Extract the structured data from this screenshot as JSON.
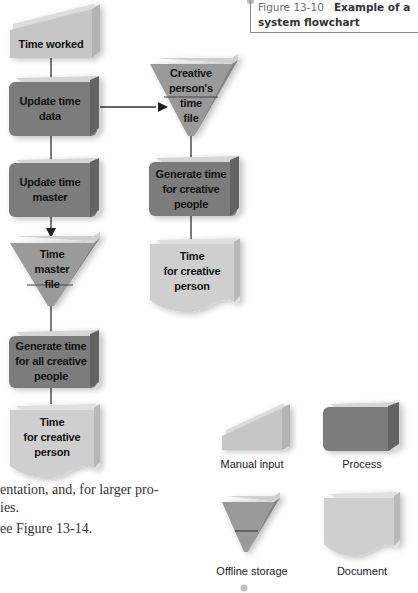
{
  "figure": {
    "number": "Figure 13-10",
    "title_line1": "Example of a",
    "title_line2": "system flowchart"
  },
  "colors": {
    "manual_input": "#c6c6c6",
    "process": "#7b7b7b",
    "storage": "#9a9a9a",
    "document": "#cfcfcf",
    "connector": "#333333"
  },
  "flowchart": {
    "nodes": [
      {
        "id": "time-worked",
        "type": "manual-input",
        "lines": [
          "Time worked"
        ]
      },
      {
        "id": "update-time-data",
        "type": "process",
        "lines": [
          "Update time",
          "data"
        ]
      },
      {
        "id": "update-time-master",
        "type": "process",
        "lines": [
          "Update time",
          "master"
        ]
      },
      {
        "id": "time-master-file",
        "type": "offline-storage",
        "lines": [
          "Time",
          "master",
          "file"
        ]
      },
      {
        "id": "generate-time-all",
        "type": "process",
        "lines": [
          "Generate time",
          "for all creative",
          "people"
        ]
      },
      {
        "id": "time-doc-left",
        "type": "document",
        "lines": [
          "Time",
          "for creative",
          "person"
        ]
      },
      {
        "id": "creative-time-file",
        "type": "offline-storage",
        "lines": [
          "Creative",
          "person's",
          "time",
          "file"
        ]
      },
      {
        "id": "generate-time-creative",
        "type": "process",
        "lines": [
          "Generate time",
          "for creative",
          "people"
        ]
      },
      {
        "id": "time-doc-right",
        "type": "document",
        "lines": [
          "Time",
          "for creative",
          "person"
        ]
      }
    ]
  },
  "legend": [
    {
      "type": "manual-input",
      "label": "Manual input"
    },
    {
      "type": "process",
      "label": "Process"
    },
    {
      "type": "offline-storage",
      "label": "Offline storage"
    },
    {
      "type": "document",
      "label": "Document"
    }
  ],
  "body_text": {
    "line1": "entation, and, for larger pro-",
    "line2": "ies.",
    "line3": "ee Figure 13-14."
  }
}
